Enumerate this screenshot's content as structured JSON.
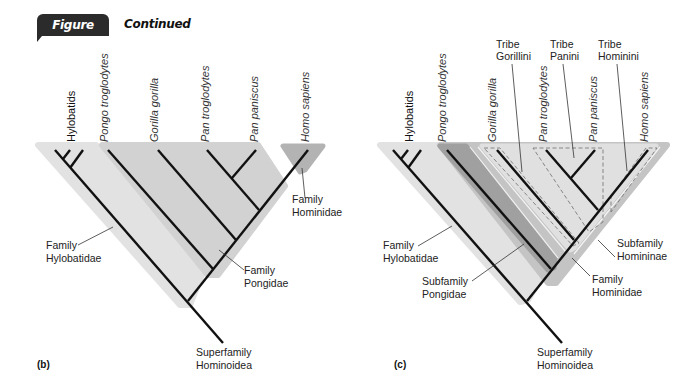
{
  "figure": {
    "number": "Figure 20.2",
    "subtitle": "Continued",
    "badge_color": "#2b2b2b"
  },
  "panel_b": {
    "label": "(b)",
    "taxa": [
      "Hylobatids",
      "Pongo troglodytes",
      "Gorilla gorilla",
      "Pan troglodytes",
      "Pan paniscus",
      "Homo sapiens"
    ],
    "groups": {
      "hylobatidae": [
        "Family",
        "Hylobatidae"
      ],
      "pongidae": [
        "Family",
        "Pongidae"
      ],
      "hominidae": [
        "Family",
        "Hominidae"
      ],
      "root": [
        "Superfamily",
        "Hominoidea"
      ]
    }
  },
  "panel_c": {
    "label": "(c)",
    "taxa": [
      "Hylobatids",
      "Pongo troglodytes",
      "Gorilla gorilla",
      "Pan troglodytes",
      "Pan paniscus",
      "Homo sapiens"
    ],
    "tribes": {
      "gorillini": [
        "Tribe",
        "Gorillini"
      ],
      "panini": [
        "Tribe",
        "Panini"
      ],
      "hominini": [
        "Tribe",
        "Hominini"
      ]
    },
    "groups": {
      "hylobatidae": [
        "Family",
        "Hylobatidae"
      ],
      "pongidae": [
        "Subfamily",
        "Pongidae"
      ],
      "homininae": [
        "Subfamily",
        "Homininae"
      ],
      "hominidae": [
        "Family",
        "Hominidae"
      ],
      "root": [
        "Superfamily",
        "Hominoidea"
      ]
    }
  },
  "colors": {
    "light": "#e2e2e2",
    "mid": "#cfcfcf",
    "dark": "#a9a9a9",
    "darker": "#8c8c8c",
    "branch": "#111111"
  }
}
